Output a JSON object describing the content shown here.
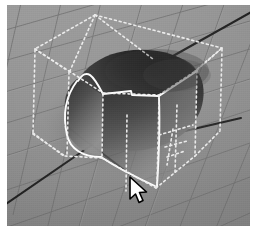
{
  "app": {
    "title": "3D Modeling Viewport",
    "description": "Perspective 3D viewport showing a shaded deformed sphere inside a dashed selection lattice box on a grid floor"
  },
  "viewport": {
    "width": 243,
    "height": 221,
    "background_color": "#8d8d8d",
    "grid": {
      "name": "perspective-floor-grid",
      "line_color": "#6f6f6f",
      "highlight_color": "#9a9a9a",
      "rows": 9,
      "cols": 9,
      "visible": true
    },
    "axes": [
      {
        "name": "axis-line-x",
        "color": "#1c1c1c",
        "from": [
          0,
          198
        ],
        "to": [
          104,
          128
        ]
      },
      {
        "name": "axis-line-z",
        "color": "#1c1c1c",
        "from": [
          152,
          58
        ],
        "to": [
          243,
          8
        ]
      },
      {
        "name": "axis-line-y",
        "color": "#262626",
        "from": [
          60,
          124
        ],
        "to": [
          130,
          176
        ]
      },
      {
        "name": "axis-segment-right",
        "color": "#1c1c1c",
        "from": [
          181,
          124
        ],
        "to": [
          232,
          113
        ]
      }
    ],
    "lattice": {
      "name": "selection-lattice-box",
      "style": "dashed",
      "color": "#f2f2f2",
      "dash_pattern": "2 3",
      "line_width": 1.6
    },
    "object": {
      "name": "shaded-sphere",
      "shading": "gradient",
      "dark_color": "#1b1b1b",
      "mid_color": "#585858",
      "light_color": "#8e8e8e",
      "edge_color": "#ffffff",
      "edge_style": "solid",
      "selected": true
    },
    "cursor": {
      "name": "mouse-pointer",
      "type": "arrow",
      "x": 121,
      "y": 171,
      "fill": "#ffffff",
      "stroke": "#000000"
    }
  },
  "colors": {
    "page_background": "#ffffff",
    "floor": "#8d8d8d",
    "grid_line": "#6f6f6f",
    "wireframe": "#f2f2f2",
    "axis": "#1c1c1c",
    "object_dark": "#1b1b1b"
  }
}
